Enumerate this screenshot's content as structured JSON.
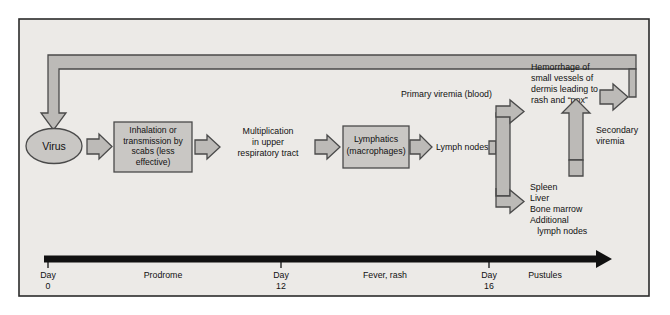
{
  "figure": {
    "frame_background": "#eceae7",
    "frame_border": "#2b2b2b",
    "shape_fill": "#c9c7c4",
    "arrow_fill": "#bcbab7",
    "arrow_stroke": "#4a4a4a",
    "text_color": "#111111"
  },
  "nodes": {
    "virus": {
      "label": "Virus",
      "shape": "ellipse"
    },
    "inhalation": {
      "shape": "box",
      "lines": [
        "Inhalation or",
        "transmission by",
        "scabs (less",
        "effective)"
      ]
    },
    "multiplication": {
      "shape": "text",
      "lines": [
        "Multiplication",
        "in upper",
        "respiratory tract"
      ]
    },
    "lymphatics": {
      "shape": "box",
      "lines": [
        "Lymphatics",
        "(macrophages)"
      ]
    },
    "lymph_nodes": {
      "shape": "text",
      "lines": [
        "Lymph nodes"
      ]
    },
    "primary_viremia": {
      "shape": "text",
      "lines": [
        "Primary viremia (blood)"
      ]
    },
    "hemorrhage": {
      "shape": "text",
      "lines": [
        "Hemorrhage of",
        "small vessels of",
        "dermis leading to",
        "rash and “pox”"
      ]
    },
    "secondary_viremia": {
      "shape": "text",
      "lines": [
        "Secondary",
        "viremia"
      ]
    },
    "organs": {
      "shape": "text",
      "lines": [
        "Spleen",
        "Liver",
        "Bone marrow",
        "Additional",
        "   lymph nodes"
      ]
    }
  },
  "timeline": {
    "ticks": [
      {
        "label_top": "Day",
        "label_bottom": "0"
      },
      {
        "label_top": "Day",
        "label_bottom": "12"
      },
      {
        "label_top": "Day",
        "label_bottom": "16"
      }
    ],
    "intervals": [
      {
        "label": "Prodrome"
      },
      {
        "label": "Fever, rash"
      },
      {
        "label": "Pustules"
      }
    ]
  },
  "icons": {
    "flow_arrow": "block-arrow-right-icon",
    "feedback_arrow": "feedback-loop-arrow-icon",
    "timeline_arrow": "timeline-arrow-right-icon",
    "up_arrow": "block-arrow-up-icon"
  }
}
